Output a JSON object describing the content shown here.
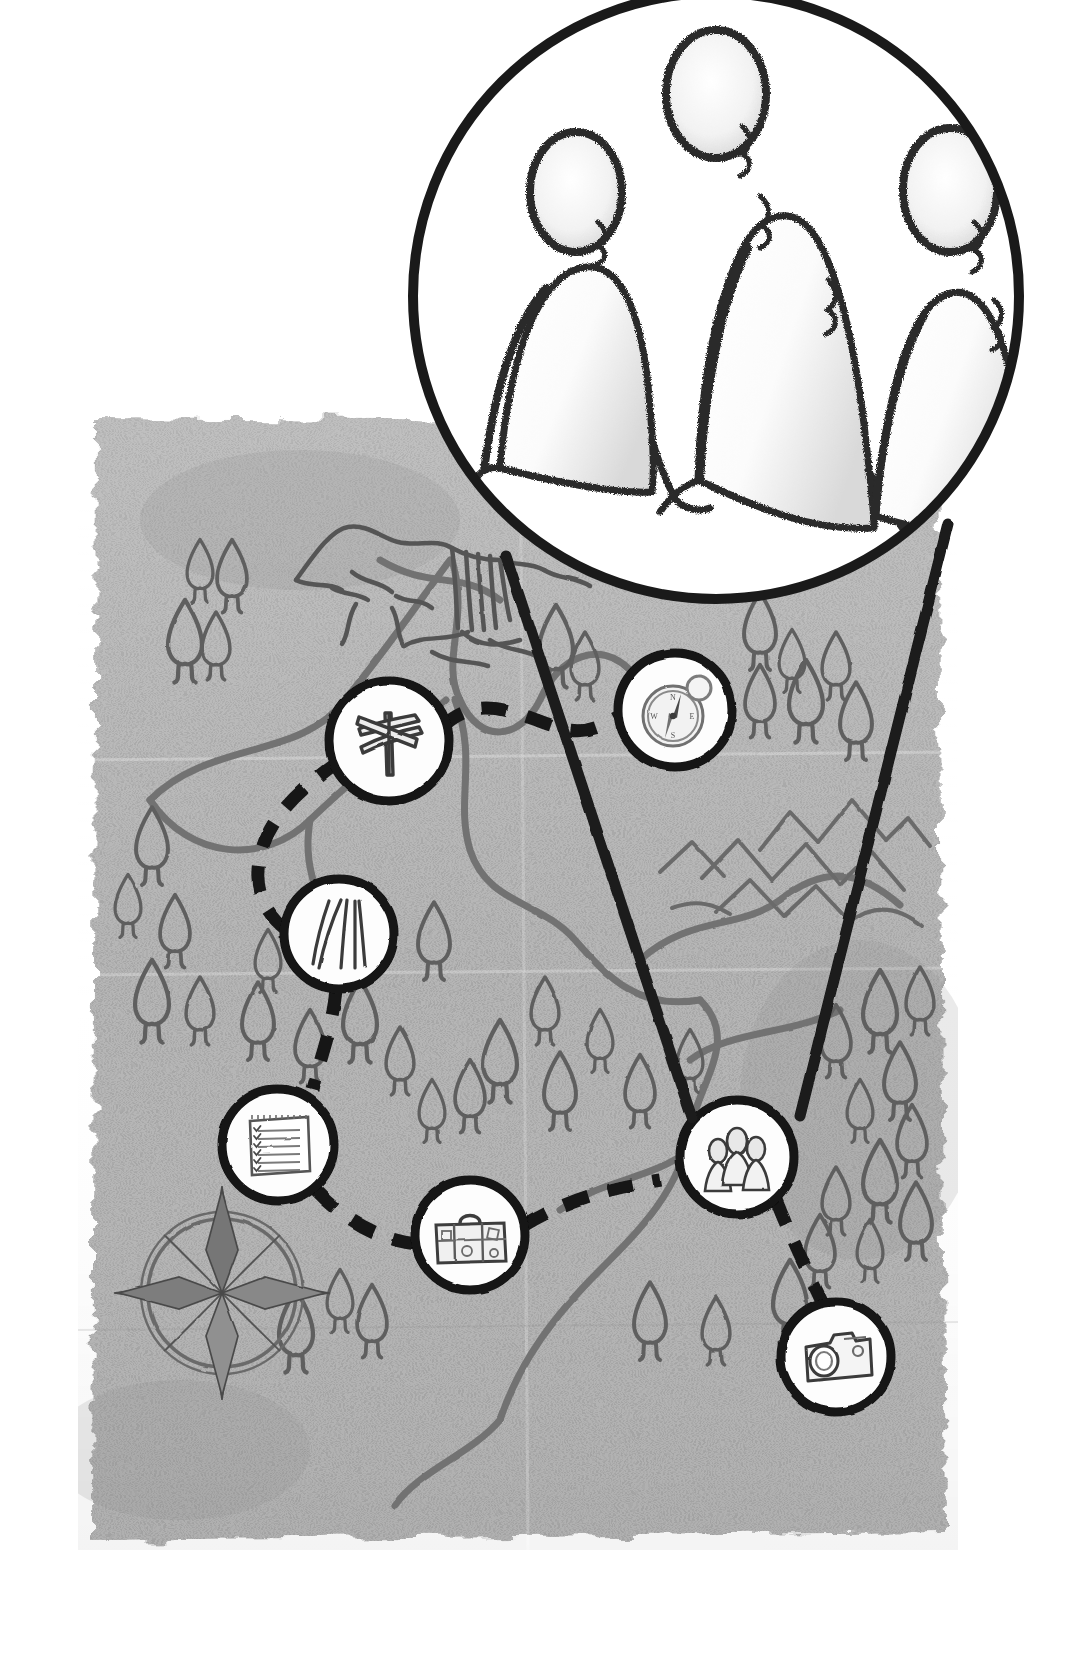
{
  "illustration": {
    "title": "Journey Map with Magnifier",
    "style": "hand-drawn charcoal sketch on aged torn paper",
    "background_color": "#ffffff",
    "paper_color": "#b3b3b3",
    "ink_color": "#111111",
    "map_line_color": "#6e6e6e"
  },
  "magnifier": {
    "name": "magnifier-lens",
    "center_x": 716,
    "center_y": 296,
    "radius": 310,
    "lens_fill": "#ffffff",
    "rim_color": "#1a1a1a",
    "rim_width": 9,
    "subject_label": "three-people-holding-hands",
    "handle_label": "magnifier-beam-lines",
    "beam_left_from": [
      503,
      561
    ],
    "beam_left_to": [
      690,
      1145
    ],
    "beam_right_from": [
      950,
      520
    ],
    "beam_right_to": [
      800,
      1140
    ]
  },
  "figures": [
    {
      "name": "figure-left",
      "head_cx": 576,
      "head_cy": 192,
      "head_rx": 44,
      "head_ry": 58,
      "body_w": 150,
      "body_h": 230
    },
    {
      "name": "figure-center",
      "head_cx": 716,
      "head_cy": 92,
      "head_rx": 48,
      "head_ry": 63,
      "body_w": 170,
      "body_h": 330
    },
    {
      "name": "figure-right",
      "head_cx": 866,
      "head_cy": 190,
      "head_rx": 45,
      "head_ry": 58,
      "body_w": 155,
      "body_h": 270
    }
  ],
  "map": {
    "name": "aged-paper-map",
    "x": 78,
    "y": 410,
    "width": 880,
    "height": 1140,
    "fold_lines": true,
    "features": [
      {
        "name": "mountain-with-waterfall",
        "x": 300,
        "y": 490,
        "label": "waterfall cliff"
      },
      {
        "name": "mountain-range",
        "x": 670,
        "y": 800,
        "label": "distant mountains"
      },
      {
        "name": "compass-rose",
        "cx": 222,
        "cy": 1293,
        "r": 78,
        "points": 8,
        "label": "compass rose"
      },
      {
        "name": "rivers",
        "label": "winding river lines"
      },
      {
        "name": "forest-trees",
        "label": "scattered stylised trees"
      }
    ]
  },
  "route": {
    "name": "dashed-journey-route",
    "style": "dashed",
    "dash_color": "#141414",
    "dash_pattern": "26 20",
    "stroke_width": 13
  },
  "waypoints": [
    {
      "id": 1,
      "name": "waypoint-signpost",
      "icon": "signpost-icon",
      "label": "Signpost",
      "cx": 389,
      "cy": 741,
      "r": 60
    },
    {
      "id": 2,
      "name": "waypoint-compass",
      "icon": "compass-icon",
      "label": "Compass",
      "cx": 675,
      "cy": 710,
      "r": 57
    },
    {
      "id": 3,
      "name": "waypoint-road",
      "icon": "road-icon",
      "label": "Road",
      "cx": 339,
      "cy": 934,
      "r": 55
    },
    {
      "id": 4,
      "name": "waypoint-checklist",
      "icon": "checklist-icon",
      "label": "Checklist",
      "cx": 278,
      "cy": 1145,
      "r": 56
    },
    {
      "id": 5,
      "name": "waypoint-suitcase",
      "icon": "suitcase-icon",
      "label": "Suitcase",
      "cx": 470,
      "cy": 1235,
      "r": 55
    },
    {
      "id": 6,
      "name": "waypoint-people",
      "icon": "people-icon",
      "label": "People",
      "cx": 737,
      "cy": 1157,
      "r": 57
    },
    {
      "id": 7,
      "name": "waypoint-camera",
      "icon": "camera-icon",
      "label": "Camera",
      "cx": 836,
      "cy": 1357,
      "r": 55
    }
  ],
  "trees": [
    [
      200,
      570
    ],
    [
      232,
      575
    ],
    [
      185,
      640
    ],
    [
      216,
      645
    ],
    [
      152,
      845
    ],
    [
      128,
      905
    ],
    [
      175,
      930
    ],
    [
      152,
      1000
    ],
    [
      200,
      1010
    ],
    [
      258,
      1020
    ],
    [
      268,
      960
    ],
    [
      310,
      1045
    ],
    [
      360,
      1020
    ],
    [
      400,
      1060
    ],
    [
      434,
      940
    ],
    [
      432,
      1110
    ],
    [
      470,
      1095
    ],
    [
      500,
      1060
    ],
    [
      545,
      1010
    ],
    [
      560,
      1090
    ],
    [
      600,
      1040
    ],
    [
      640,
      1090
    ],
    [
      556,
      645
    ],
    [
      585,
      665
    ],
    [
      760,
      630
    ],
    [
      792,
      660
    ],
    [
      760,
      700
    ],
    [
      806,
      700
    ],
    [
      836,
      665
    ],
    [
      856,
      720
    ],
    [
      690,
      1060
    ],
    [
      836,
      1040
    ],
    [
      880,
      1010
    ],
    [
      920,
      1000
    ],
    [
      900,
      1080
    ],
    [
      860,
      1110
    ],
    [
      912,
      1140
    ],
    [
      880,
      1180
    ],
    [
      836,
      1200
    ],
    [
      916,
      1220
    ],
    [
      870,
      1250
    ],
    [
      820,
      1250
    ],
    [
      790,
      1300
    ],
    [
      716,
      1330
    ],
    [
      650,
      1320
    ],
    [
      340,
      1300
    ],
    [
      372,
      1320
    ],
    [
      296,
      1330
    ]
  ]
}
